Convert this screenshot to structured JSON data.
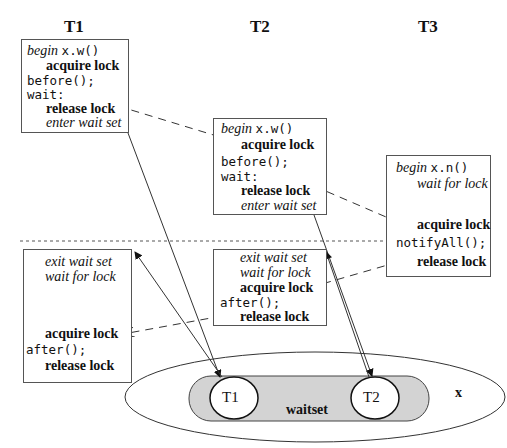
{
  "threads": [
    {
      "id": "t1",
      "title": "T1"
    },
    {
      "id": "t2",
      "title": "T2"
    },
    {
      "id": "t3",
      "title": "T3"
    }
  ],
  "boxes": {
    "t1_top": {
      "begin_kw": "begin",
      "begin_call": "x.w()",
      "acquire": "acquire lock",
      "before": "before();",
      "wait": "wait:",
      "release": "release lock",
      "enter": "enter wait set"
    },
    "t2_top": {
      "begin_kw": "begin",
      "begin_call": "x.w()",
      "acquire": "acquire lock",
      "before": "before();",
      "wait": "wait:",
      "release": "release lock",
      "enter": "enter wait set"
    },
    "t3": {
      "begin_kw": "begin",
      "begin_call": "x.n()",
      "wait_for_lock": "wait for lock",
      "acquire": "acquire lock",
      "notify": "notifyAll();",
      "release": "release lock"
    },
    "t1_bottom": {
      "exit": "exit wait set",
      "wait_for_lock": "wait for lock",
      "acquire": "acquire lock",
      "after": "after();",
      "release": "release lock"
    },
    "t2_bottom": {
      "exit": "exit wait set",
      "wait_for_lock": "wait for lock",
      "acquire": "acquire lock",
      "after": "after();",
      "release": "release lock"
    }
  },
  "object": {
    "name": "x",
    "waitset_label": "waitset",
    "members": [
      "T1",
      "T2"
    ],
    "waitset_fill": "#d3d3d3"
  }
}
